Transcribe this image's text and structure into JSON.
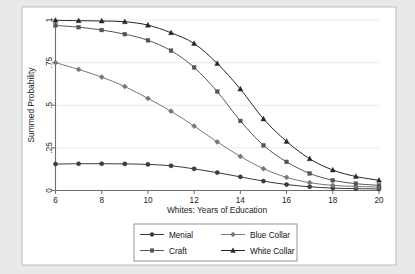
{
  "chart_data": {
    "type": "line",
    "title": "",
    "xlabel": "Whites: Years of Education",
    "ylabel": "Summed Probability",
    "xlim": [
      6,
      20
    ],
    "ylim": [
      0,
      1
    ],
    "grid": true,
    "legend_position": "below-center",
    "x": [
      6,
      7,
      8,
      9,
      10,
      11,
      12,
      13,
      14,
      15,
      16,
      17,
      18,
      19,
      20
    ],
    "xticks": [
      "6",
      "8",
      "10",
      "12",
      "14",
      "16",
      "18",
      "20"
    ],
    "xtick_values": [
      6,
      8,
      10,
      12,
      14,
      16,
      18,
      20
    ],
    "yticks": [
      "0",
      ".25",
      ".5",
      ".75",
      "1"
    ],
    "ytick_values": [
      0,
      0.25,
      0.5,
      0.75,
      1
    ],
    "series": [
      {
        "name": "Menial",
        "marker": "circle",
        "color": "#3a3a3a",
        "values": [
          0.155,
          0.157,
          0.157,
          0.156,
          0.153,
          0.145,
          0.127,
          0.105,
          0.08,
          0.055,
          0.035,
          0.022,
          0.014,
          0.011,
          0.009
        ]
      },
      {
        "name": "Blue Collar",
        "marker": "diamond",
        "color": "#777777",
        "values": [
          0.75,
          0.71,
          0.665,
          0.61,
          0.54,
          0.465,
          0.378,
          0.285,
          0.2,
          0.128,
          0.077,
          0.046,
          0.03,
          0.024,
          0.02
        ]
      },
      {
        "name": "Craft",
        "marker": "square",
        "color": "#565656",
        "values": [
          0.968,
          0.958,
          0.941,
          0.917,
          0.881,
          0.82,
          0.722,
          0.58,
          0.408,
          0.265,
          0.168,
          0.1,
          0.06,
          0.04,
          0.03
        ]
      },
      {
        "name": "White Collar",
        "marker": "triangle",
        "color": "#262626",
        "values": [
          0.998,
          0.996,
          0.994,
          0.99,
          0.97,
          0.925,
          0.862,
          0.745,
          0.595,
          0.42,
          0.288,
          0.186,
          0.12,
          0.082,
          0.06
        ]
      }
    ]
  },
  "legend": {
    "entries": [
      {
        "label": "Menial"
      },
      {
        "label": "Blue Collar"
      },
      {
        "label": "Craft"
      },
      {
        "label": "White Collar"
      }
    ]
  }
}
